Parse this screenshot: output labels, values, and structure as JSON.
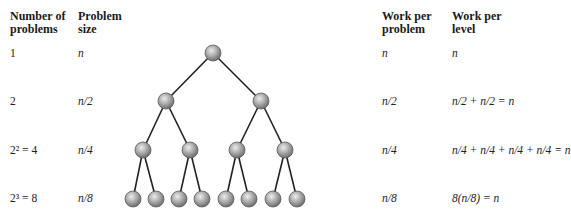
{
  "headers": {
    "num_problems": [
      "Number of",
      "problems"
    ],
    "problem_size": [
      "Problem",
      "size"
    ],
    "work_per_problem": [
      "Work per",
      "problem"
    ],
    "work_per_level": [
      "Work per",
      "level"
    ]
  },
  "rows": [
    {
      "num_problems": "1",
      "problem_size": "n",
      "work_per_problem": "n",
      "work_per_level": "n"
    },
    {
      "num_problems": "2",
      "problem_size": "n/2",
      "work_per_problem": "n/2",
      "work_per_level": "n/2 + n/2 = n"
    },
    {
      "num_problems": "2² = 4",
      "problem_size": "n/4",
      "work_per_problem": "n/4",
      "work_per_level": "n/4 + n/4 + n/4 + n/4 = n"
    },
    {
      "num_problems": "2³ = 8",
      "problem_size": "n/8",
      "work_per_problem": "n/8",
      "work_per_level": "8(n/8) = n"
    }
  ],
  "tree": {
    "levels": [
      {
        "y": 53,
        "xs": [
          213
        ]
      },
      {
        "y": 101,
        "xs": [
          166,
          261
        ]
      },
      {
        "y": 150,
        "xs": [
          143,
          190,
          237,
          285
        ]
      },
      {
        "y": 199,
        "xs": [
          133,
          156,
          179,
          202,
          226,
          249,
          273,
          297
        ]
      }
    ],
    "node_radius": 8,
    "node_color": "#9a9a9a",
    "node_highlight": "#e6e6e6",
    "edge_color": "#222222"
  }
}
